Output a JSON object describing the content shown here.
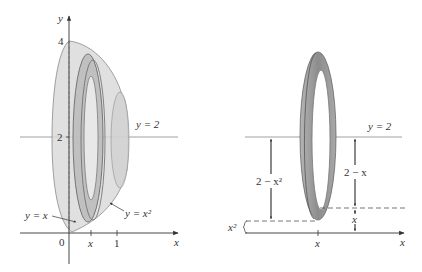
{
  "left_figure": {
    "axes": {
      "x_label": "x",
      "y_label": "y",
      "origin_label": "0",
      "x_ticks": [
        "x",
        "1"
      ],
      "y_ticks": [
        "4",
        "2"
      ]
    },
    "line_label": "y = 2",
    "curve_labels": {
      "line": "y = x",
      "parabola": "y = x²"
    }
  },
  "right_figure": {
    "line_label": "y = 2",
    "x_axis_label": "x",
    "x_tick_label": "x",
    "dimensions": {
      "outer_gap": "2 − x²",
      "inner_gap": "2 − x",
      "inner_offset": "x",
      "outer_offset": "x²"
    }
  },
  "colors": {
    "solid_fill": "#c8c8c8",
    "solid_stroke": "#8a8a8a",
    "ring_fill": "#9a9a9a",
    "axis": "#333333"
  }
}
